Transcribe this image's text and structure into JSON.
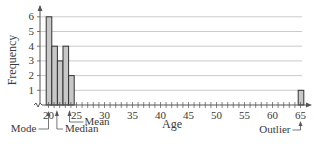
{
  "chart_data": {
    "type": "bar",
    "title": "",
    "xlabel": "Age",
    "ylabel": "Frequency",
    "x": [
      20,
      21,
      22,
      23,
      24,
      65
    ],
    "values": [
      6,
      4,
      3,
      4,
      2,
      1
    ],
    "xlim": [
      19,
      67
    ],
    "ylim": [
      0,
      6.5
    ],
    "x_ticks": [
      20,
      25,
      30,
      35,
      40,
      45,
      50,
      55,
      60,
      65
    ],
    "y_ticks": [
      1,
      2,
      3,
      4,
      5,
      6
    ],
    "grid": "horizontal",
    "legend": null,
    "x_axis_break": true,
    "annotations": [
      {
        "label": "Mode",
        "x": 20
      },
      {
        "label": "Median",
        "x": 21.5
      },
      {
        "label": "Mean",
        "x": 23.75
      },
      {
        "label": "Outlier",
        "x": 65
      }
    ],
    "colors": {
      "bar_fill": "#c8c8c8",
      "bar_stroke": "#333333",
      "grid": "#bdbdbd",
      "axis": "#555555"
    }
  }
}
